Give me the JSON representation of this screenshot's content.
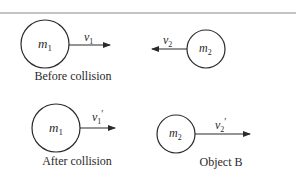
{
  "diagram": {
    "panels": {
      "before": {
        "caption": "Before collision",
        "object1": {
          "mass": "m",
          "mass_sub": "1",
          "velocity": "v",
          "velocity_sub": "1",
          "direction": "right"
        },
        "object2": {
          "mass": "m",
          "mass_sub": "2",
          "velocity": "v",
          "velocity_sub": "2",
          "direction": "left"
        }
      },
      "after": {
        "caption": "After collision",
        "object1": {
          "mass": "m",
          "mass_sub": "1",
          "velocity": "v",
          "velocity_sub": "1",
          "prime": "′",
          "direction": "right"
        }
      },
      "object_b": {
        "caption": "Object B",
        "object2": {
          "mass": "m",
          "mass_sub": "2",
          "velocity": "v",
          "velocity_sub": "2",
          "prime": "′",
          "direction": "right"
        }
      }
    },
    "colors": {
      "stroke": "#2a2a2a",
      "rule": "#8a8a8a",
      "background": "#ffffff"
    }
  }
}
